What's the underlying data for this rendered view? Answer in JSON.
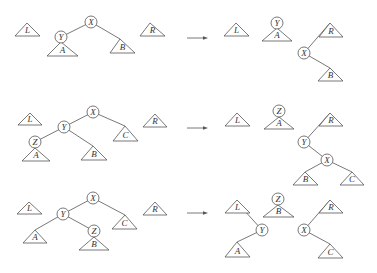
{
  "rows": [
    {
      "before": {
        "nodes": [
          {
            "id": "X",
            "x": 91,
            "y": 22
          },
          {
            "id": "Y",
            "x": 61,
            "y": 37
          }
        ],
        "subtrees": [
          {
            "id": "L",
            "apex": [
              27,
              23
            ],
            "base": [
              15,
              40,
              36
            ]
          },
          {
            "id": "A",
            "apex": [
              61,
              42
            ],
            "base": [
              47,
              78,
              56
            ]
          },
          {
            "id": "B",
            "apex": [
              120,
              39
            ],
            "base": [
              110,
              135,
              53
            ]
          },
          {
            "id": "R",
            "apex": [
              150,
              23
            ],
            "base": [
              140,
              165,
              36
            ]
          }
        ],
        "edges": [
          [
            91,
            22,
            61,
            37
          ],
          [
            91,
            22,
            120,
            39
          ]
        ]
      },
      "arrow": {
        "x1": 187,
        "x2": 208,
        "y": 38
      },
      "after": {
        "nodes": [
          {
            "id": "Y",
            "x": 277,
            "y": 23
          },
          {
            "id": "X",
            "x": 304,
            "y": 53
          }
        ],
        "subtrees": [
          {
            "id": "L",
            "apex": [
              236,
              23
            ],
            "base": [
              224,
              249,
              36
            ]
          },
          {
            "id": "A",
            "apex": [
              277,
              28
            ],
            "base": [
              262,
              292,
              41
            ]
          },
          {
            "id": "R",
            "apex": [
              330,
              23
            ],
            "base": [
              319,
              343,
              37
            ]
          },
          {
            "id": "B",
            "apex": [
              330,
              68
            ],
            "base": [
              318,
              343,
              81
            ]
          }
        ],
        "edges": [
          [
            304,
            53,
            330,
            23
          ],
          [
            304,
            53,
            330,
            68
          ]
        ]
      }
    },
    {
      "before": {
        "nodes": [
          {
            "id": "X",
            "x": 93,
            "y": 112
          },
          {
            "id": "Y",
            "x": 64,
            "y": 127
          },
          {
            "id": "Z",
            "x": 35,
            "y": 142
          }
        ],
        "subtrees": [
          {
            "id": "L",
            "apex": [
              30,
              113
            ],
            "base": [
              18,
              42,
              125
            ]
          },
          {
            "id": "A",
            "apex": [
              35,
              148
            ],
            "base": [
              22,
              50,
              161
            ]
          },
          {
            "id": "B",
            "apex": [
              93,
              146
            ],
            "base": [
              81,
              107,
              160
            ]
          },
          {
            "id": "C",
            "apex": [
              125,
              126
            ],
            "base": [
              113,
              138,
              141
            ]
          },
          {
            "id": "R",
            "apex": [
              155,
              114
            ],
            "base": [
              143,
              167,
              127
            ]
          }
        ],
        "edges": [
          [
            93,
            112,
            64,
            127
          ],
          [
            93,
            112,
            125,
            126
          ],
          [
            64,
            127,
            35,
            142
          ],
          [
            64,
            127,
            93,
            146
          ]
        ]
      },
      "arrow": {
        "x1": 187,
        "x2": 208,
        "y": 128
      },
      "after": {
        "nodes": [
          {
            "id": "Z",
            "x": 279,
            "y": 111
          },
          {
            "id": "Y",
            "x": 304,
            "y": 142
          },
          {
            "id": "X",
            "x": 327,
            "y": 160
          }
        ],
        "subtrees": [
          {
            "id": "L",
            "apex": [
              237,
              113
            ],
            "base": [
              225,
              250,
              126
            ]
          },
          {
            "id": "A",
            "apex": [
              279,
              117
            ],
            "base": [
              264,
              294,
              129
            ]
          },
          {
            "id": "R",
            "apex": [
              330,
              113
            ],
            "base": [
              319,
              343,
              126
            ]
          },
          {
            "id": "B",
            "apex": [
              305,
              172
            ],
            "base": [
              293,
              318,
              185
            ]
          },
          {
            "id": "C",
            "apex": [
              352,
              172
            ],
            "base": [
              340,
              364,
              185
            ]
          }
        ],
        "edges": [
          [
            304,
            142,
            330,
            113
          ],
          [
            304,
            142,
            327,
            160
          ],
          [
            327,
            160,
            305,
            172
          ],
          [
            327,
            160,
            352,
            172
          ]
        ]
      }
    },
    {
      "before": {
        "nodes": [
          {
            "id": "X",
            "x": 93,
            "y": 198
          },
          {
            "id": "Y",
            "x": 63,
            "y": 214
          },
          {
            "id": "Z",
            "x": 94,
            "y": 231
          }
        ],
        "subtrees": [
          {
            "id": "L",
            "apex": [
              29,
              202
            ],
            "base": [
              17,
              42,
              214
            ]
          },
          {
            "id": "A",
            "apex": [
              35,
              230
            ],
            "base": [
              23,
              47,
              243
            ]
          },
          {
            "id": "B",
            "apex": [
              94,
              237
            ],
            "base": [
              79,
              109,
              250
            ]
          },
          {
            "id": "C",
            "apex": [
              125,
              215
            ],
            "base": [
              112,
              137,
              229
            ]
          },
          {
            "id": "R",
            "apex": [
              155,
              202
            ],
            "base": [
              143,
              167,
              215
            ]
          }
        ],
        "edges": [
          [
            93,
            198,
            63,
            214
          ],
          [
            93,
            198,
            125,
            215
          ],
          [
            63,
            214,
            35,
            230
          ],
          [
            63,
            214,
            94,
            231
          ]
        ]
      },
      "arrow": {
        "x1": 187,
        "x2": 208,
        "y": 213
      },
      "after": {
        "nodes": [
          {
            "id": "Z",
            "x": 278,
            "y": 199
          },
          {
            "id": "Y",
            "x": 262,
            "y": 230
          },
          {
            "id": "X",
            "x": 304,
            "y": 230
          }
        ],
        "subtrees": [
          {
            "id": "L",
            "apex": [
              237,
              200
            ],
            "base": [
              225,
              250,
              213
            ]
          },
          {
            "id": "B",
            "apex": [
              278,
              205
            ],
            "base": [
              263,
              294,
              217
            ]
          },
          {
            "id": "R",
            "apex": [
              330,
              200
            ],
            "base": [
              319,
              343,
              213
            ]
          },
          {
            "id": "A",
            "apex": [
              237,
              242
            ],
            "base": [
              225,
              250,
              257
            ]
          },
          {
            "id": "C",
            "apex": [
              330,
              244
            ],
            "base": [
              318,
              343,
              258
            ]
          }
        ],
        "edges": [
          [
            262,
            230,
            243,
            209
          ],
          [
            262,
            230,
            237,
            242
          ],
          [
            304,
            230,
            330,
            200
          ],
          [
            304,
            230,
            330,
            244
          ]
        ]
      }
    }
  ],
  "style": {
    "stroke": "#555555",
    "node_radius": 6
  }
}
